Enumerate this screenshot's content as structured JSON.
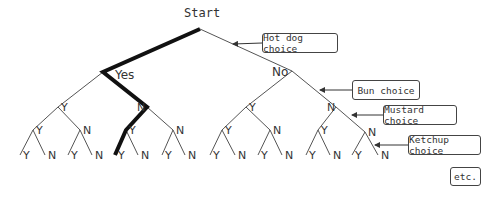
{
  "diagram": {
    "type": "decision-tree",
    "root_label": "Start",
    "level1": {
      "yes": "Yes",
      "no": "No"
    },
    "branch_labels": {
      "yes": "Y",
      "no": "N"
    },
    "highlighted_path": [
      "Start",
      "Yes",
      "N",
      "Y",
      "Y"
    ],
    "annotations": [
      {
        "label": "Hot dog choice"
      },
      {
        "label": "Bun choice"
      },
      {
        "label": "Mustard choice"
      },
      {
        "label": "Ketchup choice"
      },
      {
        "label": "etc."
      }
    ]
  }
}
